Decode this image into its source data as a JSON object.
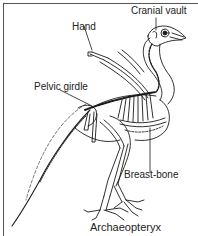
{
  "diagram": {
    "title": "Archaeopteryx",
    "labels": {
      "cranial_vault": "Cranial vault",
      "hand": "Hand",
      "pelvic_girdle": "Pelvic girdle",
      "breast_bone": "Breast-bone"
    },
    "colors": {
      "line": "#1a1a1a",
      "frame": "#555555",
      "background": "#ffffff"
    }
  }
}
